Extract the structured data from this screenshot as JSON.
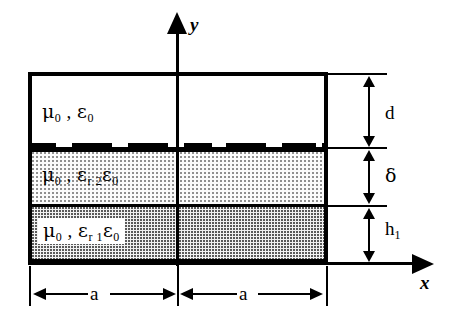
{
  "figure": {
    "type": "cross-section-diagram"
  },
  "axes": {
    "y_label": "y",
    "x_label": "x"
  },
  "layers": [
    {
      "id": "top",
      "name": "free-space-region",
      "mu": "μ",
      "mu_sub": "0",
      "separator": " , ",
      "eps": "ε",
      "eps_sub": "0",
      "eps_rel_sub": "",
      "fill": "white",
      "thickness_symbol": "d"
    },
    {
      "id": "middle",
      "name": "dielectric-region-2",
      "mu": "μ",
      "mu_sub": "0",
      "separator": " , ",
      "eps": "ε",
      "eps_rel_sub": "r 2",
      "eps2": "ε",
      "eps_sub": "0",
      "fill": "light-dotted",
      "thickness_symbol": "δ"
    },
    {
      "id": "bottom",
      "name": "dielectric-region-1",
      "mu": "μ",
      "mu_sub": "0",
      "separator": " , ",
      "eps": "ε",
      "eps_rel_sub": "r 1",
      "eps2": "ε",
      "eps_sub": "0",
      "fill": "dark-dotted",
      "thickness_symbol": "h",
      "thickness_sub": "1"
    }
  ],
  "vertical_dimensions": [
    {
      "label": "d",
      "sub": "",
      "name": "dimension-d"
    },
    {
      "label": "δ",
      "sub": "",
      "name": "dimension-delta"
    },
    {
      "label": "h",
      "sub": "1",
      "name": "dimension-h1"
    }
  ],
  "horizontal_dimensions": [
    {
      "label": "a",
      "name": "dimension-a-left"
    },
    {
      "label": "a",
      "name": "dimension-a-right"
    }
  ],
  "grating": {
    "name": "periodic-metal-strip-grating",
    "tooth_count": 7,
    "color": "#000000"
  },
  "colors": {
    "line": "#000000",
    "background": "#ffffff",
    "fill_middle": "#fbfbfb",
    "fill_bottom": "#f2f2f2"
  }
}
